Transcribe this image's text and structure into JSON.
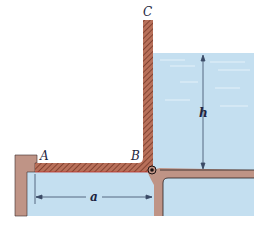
{
  "diagram": {
    "type": "hinged-gate-water-tank",
    "labels": {
      "point_A": "A",
      "point_B": "B",
      "point_C": "C",
      "height_dim": "h",
      "length_dim": "a"
    },
    "colors": {
      "background": "#ffffff",
      "water": "#c4dff0",
      "water_ripple": "#e3f1fa",
      "wall": "#bf9486",
      "wall_outline": "#2a2020",
      "gate": "#b8705a",
      "gate_hatch": "#6f3020",
      "dimension_line": "#3a4a66",
      "label": "#1d2540",
      "hinge": "#1a1010"
    },
    "components": [
      {
        "name": "gate-arm-AB",
        "description": "horizontal hatched arm from A to B"
      },
      {
        "name": "gate-arm-BC",
        "description": "vertical hatched arm from B to C"
      },
      {
        "name": "hinge",
        "description": "pin at corner B"
      },
      {
        "name": "water-right",
        "description": "water of depth h on right side"
      },
      {
        "name": "water-below",
        "description": "water beneath gate arm AB"
      },
      {
        "name": "left-wall",
        "description": "support wall with stop at A"
      },
      {
        "name": "right-wall",
        "description": "channel walls meeting at hinge"
      }
    ]
  }
}
